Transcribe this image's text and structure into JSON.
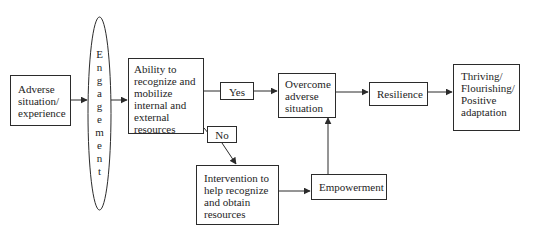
{
  "diagram": {
    "nodes": {
      "adverse": {
        "lines": [
          "Adverse",
          "situation/",
          "experience"
        ]
      },
      "engagement": {
        "label": "Engagement",
        "letters": [
          "E",
          "n",
          "g",
          "a",
          "g",
          "e",
          "m",
          "e",
          "n",
          "t"
        ]
      },
      "ability": {
        "lines": [
          "Ability to",
          "recognize and",
          "mobilize",
          "internal and",
          "external",
          "resources"
        ]
      },
      "overcome": {
        "lines": [
          "Overcome",
          "adverse",
          "situation"
        ]
      },
      "resilience": {
        "lines": [
          "Resilience"
        ]
      },
      "thriving": {
        "lines": [
          "Thriving/",
          "Flourishing/",
          "Positive",
          "adaptation"
        ]
      },
      "intervention": {
        "lines": [
          "Intervention to",
          "help recognize",
          "and obtain",
          "resources"
        ]
      },
      "empowerment": {
        "lines": [
          "Empowerment"
        ]
      }
    },
    "edge_labels": {
      "yes": "Yes",
      "no": "No"
    },
    "edges": [
      {
        "from": "adverse",
        "to": "engagement"
      },
      {
        "from": "engagement",
        "to": "ability"
      },
      {
        "from": "ability",
        "to": "overcome",
        "label": "Yes"
      },
      {
        "from": "ability",
        "to": "intervention",
        "label": "No"
      },
      {
        "from": "overcome",
        "to": "resilience"
      },
      {
        "from": "resilience",
        "to": "thriving"
      },
      {
        "from": "intervention",
        "to": "empowerment"
      },
      {
        "from": "empowerment",
        "to": "overcome"
      }
    ],
    "colors": {
      "stroke": "#2b2b2b",
      "text": "#1e1e1e",
      "background": "#ffffff"
    }
  }
}
